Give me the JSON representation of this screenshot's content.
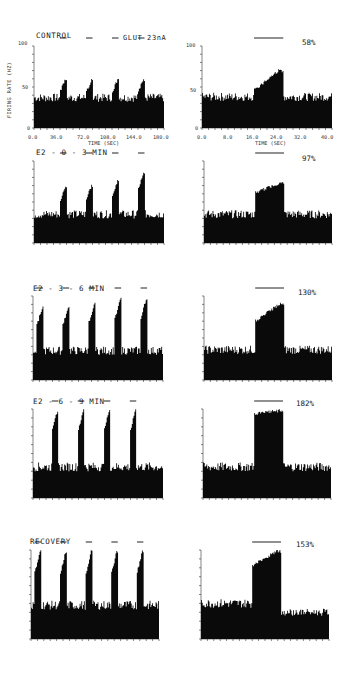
{
  "figure": {
    "ylabel": "FIRING RATE (HZ)",
    "xlabel": "TIME (SEC)",
    "stimulus_label": "GLUT 23nA",
    "left_xticks": [
      "0.0",
      "36.0",
      "72.0",
      "108.0",
      "144.0",
      "180.0"
    ],
    "right_xticks": [
      "0.0",
      "8.0",
      "16.0",
      "24.0",
      "32.0",
      "40.0"
    ],
    "yticks": [
      "0",
      "50",
      "100"
    ]
  },
  "panels": [
    {
      "label": "CONTROL",
      "response_pct": "58%"
    },
    {
      "label": "E2 - 0 - 3 MIN",
      "response_pct": "97%"
    },
    {
      "label": "E2 - 3 - 6 MIN",
      "response_pct": "130%"
    },
    {
      "label": "E2 - 6 - 9 MIN",
      "response_pct": "182%"
    },
    {
      "label": "RECOVERY",
      "response_pct": "153%"
    }
  ],
  "chart_data": [
    {
      "type": "bar",
      "title": "CONTROL",
      "subtitle": "GLUT 23nA",
      "xlabel": "TIME (SEC)",
      "ylabel": "FIRING RATE (HZ)",
      "xlim": [
        0,
        180
      ],
      "ylim": [
        0,
        100
      ],
      "x_ticks": [
        0,
        36,
        72,
        108,
        144,
        180
      ],
      "baseline_hz": 37,
      "pulses": [
        {
          "start": 36,
          "end": 45,
          "peak_hz": 62
        },
        {
          "start": 72,
          "end": 81,
          "peak_hz": 60
        },
        {
          "start": 108,
          "end": 117,
          "peak_hz": 60
        },
        {
          "start": 144,
          "end": 153,
          "peak_hz": 61
        }
      ],
      "grid": false
    },
    {
      "type": "bar",
      "title": "CONTROL (expanded single pulse)",
      "annotation": "58%",
      "xlabel": "TIME (SEC)",
      "ylabel": "FIRING RATE (HZ)",
      "xlim": [
        0,
        40
      ],
      "ylim": [
        0,
        100
      ],
      "x_ticks": [
        0,
        8,
        16,
        24,
        32,
        40
      ],
      "baseline_hz": 38,
      "pulse": {
        "start": 16,
        "end": 25,
        "peak_hz": 72,
        "mean_hz": 60
      },
      "grid": false
    },
    {
      "type": "bar",
      "title": "E2 - 0 - 3 MIN",
      "xlim": [
        0,
        180
      ],
      "ylim": [
        0,
        100
      ],
      "baseline_hz": 35,
      "pulses": [
        {
          "start": 36,
          "end": 45,
          "peak_hz": 70
        },
        {
          "start": 72,
          "end": 81,
          "peak_hz": 72
        },
        {
          "start": 108,
          "end": 117,
          "peak_hz": 77
        },
        {
          "start": 144,
          "end": 153,
          "peak_hz": 88
        }
      ]
    },
    {
      "type": "bar",
      "title": "E2 - 0 - 3 MIN (expanded)",
      "annotation": "97%",
      "xlim": [
        0,
        40
      ],
      "ylim": [
        0,
        100
      ],
      "baseline_hz": 35,
      "pulse": {
        "start": 16,
        "end": 25,
        "peak_hz": 75,
        "mean_hz": 69
      }
    },
    {
      "type": "bar",
      "title": "E2 - 3 - 6 MIN",
      "xlim": [
        0,
        180
      ],
      "ylim": [
        0,
        100
      ],
      "baseline_hz": 35,
      "pulses": [
        {
          "start": 5,
          "end": 14,
          "peak_hz": 88
        },
        {
          "start": 41,
          "end": 50,
          "peak_hz": 88
        },
        {
          "start": 77,
          "end": 86,
          "peak_hz": 92
        },
        {
          "start": 113,
          "end": 122,
          "peak_hz": 98
        },
        {
          "start": 149,
          "end": 158,
          "peak_hz": 98
        }
      ]
    },
    {
      "type": "bar",
      "title": "E2 - 3 - 6 MIN (expanded)",
      "annotation": "130%",
      "xlim": [
        0,
        40
      ],
      "ylim": [
        0,
        100
      ],
      "baseline_hz": 36,
      "pulse": {
        "start": 16,
        "end": 25,
        "peak_hz": 92,
        "mean_hz": 82
      }
    },
    {
      "type": "bar",
      "title": "E2 - 6 - 9 MIN",
      "xlim": [
        0,
        180
      ],
      "ylim": [
        0,
        100
      ],
      "baseline_hz": 35,
      "pulses": [
        {
          "start": 26,
          "end": 35,
          "peak_hz": 100
        },
        {
          "start": 62,
          "end": 71,
          "peak_hz": 100
        },
        {
          "start": 98,
          "end": 107,
          "peak_hz": 100
        },
        {
          "start": 134,
          "end": 143,
          "peak_hz": 100
        }
      ]
    },
    {
      "type": "bar",
      "title": "E2 - 6 - 9 MIN (expanded)",
      "annotation": "182%",
      "xlim": [
        0,
        40
      ],
      "ylim": [
        0,
        100
      ],
      "baseline_hz": 35,
      "pulse": {
        "start": 16,
        "end": 25,
        "peak_hz": 100,
        "mean_hz": 98
      }
    },
    {
      "type": "bar",
      "title": "RECOVERY",
      "xlim": [
        0,
        180
      ],
      "ylim": [
        0,
        100
      ],
      "baseline_hz": 38,
      "pulses": [
        {
          "start": 5,
          "end": 14,
          "peak_hz": 100
        },
        {
          "start": 41,
          "end": 50,
          "peak_hz": 100
        },
        {
          "start": 77,
          "end": 86,
          "peak_hz": 100
        },
        {
          "start": 113,
          "end": 122,
          "peak_hz": 100
        },
        {
          "start": 149,
          "end": 158,
          "peak_hz": 100
        }
      ]
    },
    {
      "type": "bar",
      "title": "RECOVERY (expanded)",
      "annotation": "153%",
      "xlim": [
        0,
        40
      ],
      "ylim": [
        0,
        100
      ],
      "baseline_hz": 40,
      "pulse": {
        "start": 16,
        "end": 25,
        "peak_hz": 100,
        "mean_hz": 92
      },
      "post_baseline_hz": 30
    }
  ]
}
